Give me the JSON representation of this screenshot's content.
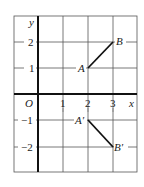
{
  "diagram": {
    "type": "coordinate-grid-reflection",
    "axes": {
      "x_label": "x",
      "y_label": "y",
      "origin_label": "O",
      "x_ticks": [
        "1",
        "2",
        "3"
      ],
      "y_ticks_positive": [
        "1",
        "2"
      ],
      "y_ticks_negative": [
        "−1",
        "−2"
      ]
    },
    "grid": {
      "x_range": [
        -1,
        4
      ],
      "y_range": [
        -3,
        3
      ],
      "line_color": "#555555",
      "axis_color": "#111111"
    },
    "segments": [
      {
        "name": "AB",
        "from": {
          "label": "A",
          "x": 2,
          "y": 1
        },
        "to": {
          "label": "B",
          "x": 3,
          "y": 2
        }
      },
      {
        "name": "A'B'",
        "from": {
          "label": "A′",
          "x": 2,
          "y": -1
        },
        "to": {
          "label": "B′",
          "x": 3,
          "y": -2
        }
      }
    ]
  }
}
